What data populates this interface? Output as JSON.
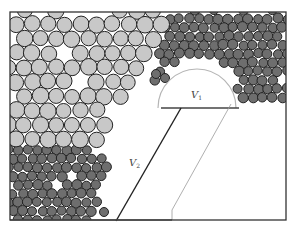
{
  "diagram": {
    "title": "",
    "regions": [
      {
        "id": "coarse-particles",
        "description": "large light gray particles",
        "fill": "#c8c8c8",
        "stroke": "#222222"
      },
      {
        "id": "fine-particles-upper-right",
        "description": "small dark gray particles",
        "fill": "#6e6e6e",
        "stroke": "#222222"
      },
      {
        "id": "fine-particles-lower-left",
        "description": "small dark gray particles",
        "fill": "#6e6e6e",
        "stroke": "#222222"
      }
    ],
    "labels": {
      "v1": {
        "main": "V",
        "sub": "1"
      },
      "v2": {
        "main": "V",
        "sub": "2"
      }
    },
    "colors": {
      "frame": "#333333",
      "boundary_dark": "#222222",
      "boundary_light": "#a0a0a0",
      "semicircle": "#b0b0b0",
      "background": "#ffffff"
    }
  }
}
